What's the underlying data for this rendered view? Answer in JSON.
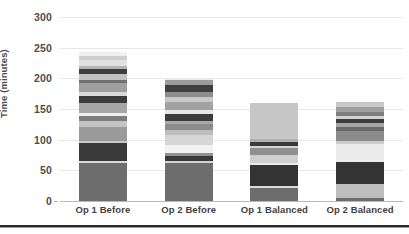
{
  "chart_data": {
    "type": "bar",
    "subtype": "stacked-bar",
    "title": "",
    "xlabel": "",
    "ylabel": "Time (minutes)",
    "ylim": [
      0,
      300
    ],
    "ytick_step": 50,
    "yticks": [
      "0",
      "50",
      "100",
      "150",
      "200",
      "250",
      "300"
    ],
    "grid": true,
    "legend": "none",
    "palette": "grayscale",
    "categories": [
      "Op 1 Before",
      "Op 2 Before",
      "Op 1 Balanced",
      "Op 2 Balanced"
    ],
    "totals": [
      253,
      201,
      160,
      161
    ],
    "stacks": [
      {
        "category": "Op 1 Before",
        "total": 253,
        "segments": [
          {
            "value": 62,
            "color": "#6d6d6d"
          },
          {
            "value": 4,
            "color": "#d8d8d8"
          },
          {
            "value": 28,
            "color": "#3a3a3a"
          },
          {
            "value": 4,
            "color": "#c9c9c9"
          },
          {
            "value": 22,
            "color": "#9a9a9a"
          },
          {
            "value": 10,
            "color": "#c4c4c4"
          },
          {
            "value": 9,
            "color": "#7d7d7d"
          },
          {
            "value": 5,
            "color": "#ededed"
          },
          {
            "value": 16,
            "color": "#a5a5a5"
          },
          {
            "value": 11,
            "color": "#3c3c3c"
          },
          {
            "value": 7,
            "color": "#dadada"
          },
          {
            "value": 14,
            "color": "#9f9f9f"
          },
          {
            "value": 6,
            "color": "#6f6f6f"
          },
          {
            "value": 9,
            "color": "#c2c2c2"
          },
          {
            "value": 8,
            "color": "#3f3f3f"
          },
          {
            "value": 6,
            "color": "#b5b5b5"
          },
          {
            "value": 9,
            "color": "#e2e2e2"
          },
          {
            "value": 6,
            "color": "#cfcfcf"
          },
          {
            "value": 7,
            "color": "#f0f0f0"
          }
        ]
      },
      {
        "category": "Op 2 Before",
        "total": 201,
        "segments": [
          {
            "value": 62,
            "color": "#6d6d6d"
          },
          {
            "value": 4,
            "color": "#d2d2d2"
          },
          {
            "value": 8,
            "color": "#3a3a3a"
          },
          {
            "value": 4,
            "color": "#8f8f8f"
          },
          {
            "value": 14,
            "color": "#f2f2f2"
          },
          {
            "value": 16,
            "color": "#d6d6d6"
          },
          {
            "value": 8,
            "color": "#bdbdbd"
          },
          {
            "value": 9,
            "color": "#8b8b8b"
          },
          {
            "value": 6,
            "color": "#a8a8a8"
          },
          {
            "value": 11,
            "color": "#3c3c3c"
          },
          {
            "value": 6,
            "color": "#e6e6e6"
          },
          {
            "value": 14,
            "color": "#a2a2a2"
          },
          {
            "value": 7,
            "color": "#c8c8c8"
          },
          {
            "value": 9,
            "color": "#8d8d8d"
          },
          {
            "value": 11,
            "color": "#3f3f3f"
          },
          {
            "value": 8,
            "color": "#9b9b9b"
          },
          {
            "value": 4,
            "color": "#ebebeb"
          }
        ]
      },
      {
        "category": "Op 1 Balanced",
        "total": 160,
        "segments": [
          {
            "value": 22,
            "color": "#6d6d6d"
          },
          {
            "value": 3,
            "color": "#dcdcdc"
          },
          {
            "value": 33,
            "color": "#333333"
          },
          {
            "value": 4,
            "color": "#e8e8e8"
          },
          {
            "value": 13,
            "color": "#cfcfcf"
          },
          {
            "value": 11,
            "color": "#8f8f8f"
          },
          {
            "value": 4,
            "color": "#d4d4d4"
          },
          {
            "value": 7,
            "color": "#3a3a3a"
          },
          {
            "value": 4,
            "color": "#b0b0b0"
          },
          {
            "value": 59,
            "color": "#c6c6c6"
          }
        ]
      },
      {
        "category": "Op 2 Balanced",
        "total": 161,
        "segments": [
          {
            "value": 5,
            "color": "#6d6d6d"
          },
          {
            "value": 22,
            "color": "#bdbdbd"
          },
          {
            "value": 36,
            "color": "#333333"
          },
          {
            "value": 30,
            "color": "#ececec"
          },
          {
            "value": 5,
            "color": "#cccccc"
          },
          {
            "value": 16,
            "color": "#8b8b8b"
          },
          {
            "value": 7,
            "color": "#6a6a6a"
          },
          {
            "value": 6,
            "color": "#a6a6a6"
          },
          {
            "value": 7,
            "color": "#3c3c3c"
          },
          {
            "value": 5,
            "color": "#d2d2d2"
          },
          {
            "value": 7,
            "color": "#7f7f7f"
          },
          {
            "value": 7,
            "color": "#a0a0a0"
          },
          {
            "value": 8,
            "color": "#c8c8c8"
          }
        ]
      }
    ]
  },
  "style": {
    "background": "#ffffff",
    "gridline_color": "#e8e8e8",
    "axis_color": "#b9b9b9",
    "label_color": "#4d4d4d",
    "rule_color": "#2b2b2b"
  }
}
